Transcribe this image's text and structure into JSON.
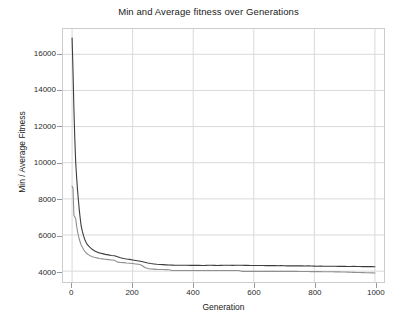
{
  "chart_data": {
    "type": "line",
    "title": "Min and Average fitness over Generations",
    "xlabel": "Generation",
    "ylabel": "Min / Average Fitness",
    "xlim": [
      -30,
      1030
    ],
    "ylim": [
      3400,
      17400
    ],
    "xticks": [
      0,
      200,
      400,
      600,
      800,
      1000
    ],
    "yticks": [
      4000,
      6000,
      8000,
      10000,
      12000,
      14000,
      16000
    ],
    "xtick_labels": [
      "0",
      "200",
      "400",
      "600",
      "800",
      "1000"
    ],
    "ytick_labels": [
      "4000",
      "6000",
      "8000",
      "10000",
      "12000",
      "14000",
      "16000"
    ],
    "grid": true,
    "grid_color": "#d9d9d9",
    "legend": null,
    "frame_color": "#cccccc",
    "background": "#ffffff",
    "series": [
      {
        "name": "Average",
        "color": "#3d3d3d",
        "width": 1.1,
        "x": [
          0,
          3,
          6,
          9,
          12,
          15,
          18,
          21,
          24,
          27,
          30,
          34,
          38,
          42,
          46,
          50,
          55,
          60,
          65,
          70,
          75,
          80,
          85,
          90,
          95,
          100,
          110,
          120,
          130,
          140,
          150,
          160,
          170,
          180,
          190,
          200,
          210,
          220,
          230,
          240,
          250,
          260,
          270,
          280,
          290,
          300,
          310,
          320,
          330,
          340,
          350,
          360,
          370,
          380,
          390,
          400,
          410,
          420,
          430,
          440,
          450,
          460,
          470,
          480,
          490,
          500,
          510,
          520,
          530,
          540,
          550,
          560,
          570,
          580,
          590,
          600,
          610,
          620,
          630,
          640,
          650,
          660,
          670,
          680,
          690,
          700,
          710,
          720,
          730,
          740,
          750,
          760,
          770,
          780,
          790,
          800,
          810,
          820,
          830,
          840,
          850,
          860,
          870,
          880,
          890,
          900,
          910,
          920,
          930,
          940,
          950,
          960,
          970,
          980,
          990,
          1000
        ],
        "y": [
          16900,
          15100,
          13000,
          11300,
          10000,
          9200,
          8500,
          7900,
          7350,
          6900,
          6500,
          6200,
          5950,
          5750,
          5600,
          5480,
          5380,
          5300,
          5230,
          5170,
          5120,
          5080,
          5040,
          5010,
          4990,
          4970,
          4930,
          4900,
          4870,
          4850,
          4800,
          4740,
          4700,
          4670,
          4650,
          4620,
          4590,
          4560,
          4530,
          4490,
          4450,
          4420,
          4400,
          4380,
          4370,
          4360,
          4350,
          4340,
          4335,
          4330,
          4330,
          4325,
          4330,
          4325,
          4320,
          4320,
          4325,
          4320,
          4315,
          4320,
          4330,
          4325,
          4320,
          4315,
          4320,
          4325,
          4330,
          4325,
          4320,
          4325,
          4330,
          4325,
          4320,
          4318,
          4315,
          4312,
          4310,
          4315,
          4312,
          4308,
          4305,
          4310,
          4305,
          4300,
          4305,
          4300,
          4295,
          4300,
          4295,
          4290,
          4295,
          4290,
          4285,
          4290,
          4285,
          4280,
          4275,
          4280,
          4275,
          4270,
          4268,
          4272,
          4268,
          4265,
          4262,
          4265,
          4260,
          4258,
          4262,
          4258,
          4255,
          4252,
          4255,
          4250,
          4248,
          4245
        ]
      },
      {
        "name": "Min",
        "color": "#8f8f8f",
        "width": 1.1,
        "x": [
          0,
          3,
          6,
          9,
          12,
          15,
          18,
          21,
          24,
          27,
          30,
          34,
          38,
          42,
          46,
          50,
          55,
          60,
          65,
          70,
          75,
          80,
          85,
          90,
          95,
          100,
          110,
          120,
          130,
          140,
          150,
          160,
          170,
          180,
          190,
          200,
          210,
          220,
          230,
          240,
          250,
          260,
          270,
          280,
          290,
          300,
          310,
          320,
          330,
          340,
          350,
          360,
          370,
          380,
          390,
          400,
          410,
          420,
          430,
          440,
          450,
          460,
          470,
          480,
          490,
          500,
          510,
          520,
          530,
          540,
          550,
          560,
          570,
          580,
          590,
          600,
          610,
          620,
          630,
          640,
          650,
          660,
          670,
          680,
          690,
          700,
          710,
          720,
          730,
          740,
          750,
          760,
          770,
          780,
          790,
          800,
          810,
          820,
          830,
          840,
          850,
          860,
          870,
          880,
          890,
          900,
          910,
          920,
          930,
          940,
          950,
          960,
          970,
          980,
          990,
          1000
        ],
        "y": [
          8700,
          8600,
          7100,
          7000,
          6900,
          6500,
          6200,
          5950,
          5750,
          5600,
          5450,
          5320,
          5200,
          5100,
          5020,
          4960,
          4900,
          4850,
          4810,
          4780,
          4760,
          4740,
          4720,
          4700,
          4690,
          4680,
          4660,
          4640,
          4620,
          4600,
          4500,
          4480,
          4470,
          4450,
          4440,
          4420,
          4400,
          4380,
          4330,
          4200,
          4150,
          4120,
          4110,
          4100,
          4095,
          4090,
          4085,
          4080,
          4040,
          4035,
          4035,
          4035,
          4035,
          4035,
          4035,
          4035,
          4035,
          4035,
          4035,
          4035,
          4035,
          4035,
          4035,
          4035,
          4035,
          4035,
          4035,
          4035,
          4035,
          4035,
          4035,
          3990,
          3985,
          3985,
          3985,
          3985,
          3985,
          3985,
          3985,
          3985,
          3985,
          3985,
          3985,
          3985,
          3985,
          3985,
          3985,
          3985,
          3985,
          3985,
          3980,
          3980,
          3978,
          3978,
          3975,
          3975,
          3972,
          3972,
          3970,
          3968,
          3968,
          3965,
          3962,
          3960,
          3955,
          3950,
          3945,
          3940,
          3935,
          3930,
          3925,
          3920,
          3915,
          3910,
          3905,
          3900
        ]
      }
    ]
  }
}
